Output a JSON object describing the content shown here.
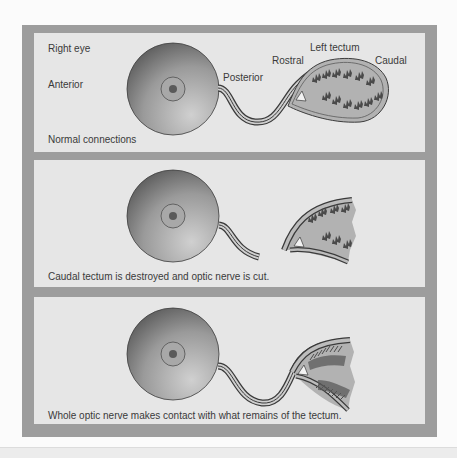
{
  "figure": {
    "panels": [
      {
        "id": "normal",
        "labels": {
          "eye": "Right eye",
          "anterior": "Anterior",
          "posterior": "Posterior",
          "rostral": "Rostral",
          "tectum": "Left tectum",
          "caudal": "Caudal"
        },
        "caption": "Normal connections"
      },
      {
        "id": "lesion",
        "caption": "Caudal tectum is destroyed and optic nerve is cut."
      },
      {
        "id": "regeneration",
        "caption": "Whole optic nerve makes contact with what remains of the tectum."
      }
    ],
    "colors": {
      "frame": "#9d9d9d",
      "panel_bg": "#e6e6e6",
      "eye_dark": "#5a5a5a",
      "eye_light": "#c4c4c4",
      "tectum_fill": "#b4b4b4",
      "text": "#3a3a3a"
    }
  }
}
